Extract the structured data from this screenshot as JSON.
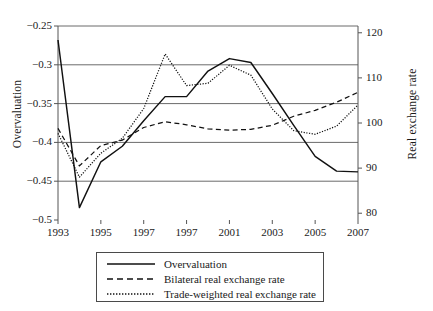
{
  "chart_data": {
    "type": "line",
    "title": "",
    "xlabel": "",
    "ylabel": "Overvaluation",
    "ylabel_right": "Real exchange rate",
    "grid": true,
    "legend_position": "below-center",
    "xlim": [
      1993,
      2007
    ],
    "ylim": [
      -0.5,
      -0.25
    ],
    "ylim_right": [
      78.5,
      121.5
    ],
    "xticks": [
      1993,
      1995,
      1997,
      1999,
      2001,
      2003,
      2005,
      2007
    ],
    "xtick_labels": [
      "1993",
      "1995",
      "1997",
      "1997",
      "2001",
      "2003",
      "2005",
      "2007"
    ],
    "yticks": [
      -0.25,
      -0.3,
      -0.35,
      -0.4,
      -0.45,
      -0.5
    ],
    "ytick_labels": [
      "−0.25",
      "−0.3",
      "−0.35",
      "−0.4",
      "−0.45",
      "−0.5"
    ],
    "yticks_right": [
      120,
      110,
      100,
      90,
      80
    ],
    "ytick_labels_right": [
      "120",
      "110",
      "100",
      "90",
      "80"
    ],
    "series": [
      {
        "name": "Overvaluation",
        "axis": "left",
        "style": "solid",
        "color": "#111111",
        "x": [
          1993,
          1994,
          1995,
          1996,
          1997,
          1998,
          1999,
          2000,
          2001,
          2002,
          2003,
          2004,
          2005,
          2006,
          2007
        ],
        "values": [
          -0.268,
          -0.484,
          -0.425,
          -0.405,
          -0.372,
          -0.341,
          -0.341,
          -0.308,
          -0.292,
          -0.297,
          -0.337,
          -0.378,
          -0.418,
          -0.437,
          -0.438
        ]
      },
      {
        "name": "Bilateral real exchange rate",
        "axis": "right",
        "style": "dashed",
        "color": "#111111",
        "x": [
          1993,
          1994,
          1995,
          1996,
          1997,
          1998,
          1999,
          2000,
          2001,
          2002,
          2003,
          2004,
          2005,
          2006,
          2007
        ],
        "values": [
          98.8,
          90.5,
          95.0,
          96.2,
          99.0,
          100.3,
          99.6,
          98.7,
          98.4,
          98.6,
          99.5,
          101.5,
          102.8,
          104.6,
          106.8
        ]
      },
      {
        "name": "Trade-weighted real exchange rate",
        "axis": "right",
        "style": "dotted",
        "color": "#111111",
        "x": [
          1993,
          1994,
          1995,
          1996,
          1997,
          1998,
          1999,
          2000,
          2001,
          2002,
          2003,
          2004,
          2005,
          2006,
          2007
        ],
        "values": [
          97.7,
          88.0,
          93.3,
          96.6,
          103.2,
          115.3,
          108.3,
          108.8,
          112.8,
          110.6,
          103.1,
          98.3,
          97.5,
          99.3,
          104.0
        ]
      }
    ]
  },
  "legend": {
    "items": [
      {
        "label": "Overvaluation",
        "style": "solid"
      },
      {
        "label": "Bilateral real exchange rate",
        "style": "dashed"
      },
      {
        "label": "Trade-weighted real exchange rate",
        "style": "dotted"
      }
    ]
  }
}
